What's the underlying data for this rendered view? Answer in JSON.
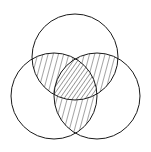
{
  "diagram": {
    "type": "venn-3",
    "background": "#ffffff",
    "stroke_color": "#1a1a1a",
    "circles": [
      {
        "id": "top",
        "cx": 75,
        "cy": 57,
        "r": 43
      },
      {
        "id": "left",
        "cx": 54,
        "cy": 96,
        "r": 43
      },
      {
        "id": "right",
        "cx": 97,
        "cy": 96,
        "r": 43
      }
    ],
    "shaded_regions": [
      "top∩left",
      "top∩right",
      "left∩right",
      "top∩left∩right"
    ],
    "hatch_styles": {
      "pairwise": "sparse near-vertical lines",
      "triple": "dense diagonal lines"
    }
  }
}
